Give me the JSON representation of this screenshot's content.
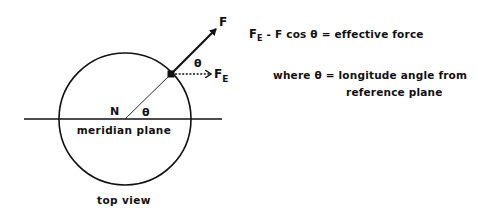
{
  "diagram": {
    "labels": {
      "force": "F",
      "effective_force": "F",
      "effective_force_sub": "E",
      "theta_upper": "θ",
      "theta_lower": "θ",
      "north": "N",
      "meridian_plane": "meridian plane",
      "caption": "top view"
    },
    "equation": {
      "lhs_symbol": "F",
      "lhs_sub": "E",
      "rhs": " - F cos θ = effective force"
    },
    "definition": {
      "line1": "where θ = longitude angle from",
      "line2": "reference plane"
    },
    "geometry": {
      "circle_center": [
        125,
        119
      ],
      "circle_radius": 66,
      "meridian_line": [
        24,
        222
      ],
      "point_on_circle": [
        171,
        74
      ],
      "force_tip": [
        218,
        27
      ],
      "effective_force_tip": [
        211,
        74
      ]
    },
    "colors": {
      "ink": "#111111",
      "background": "#ffffff"
    }
  }
}
